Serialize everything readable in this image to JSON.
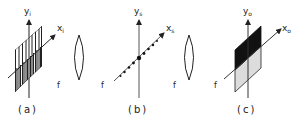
{
  "figure": {
    "panels": [
      {
        "id": "a",
        "label": "(a)",
        "y_axis": {
          "name": "y",
          "subscript": "i"
        },
        "x_axis": {
          "name": "x",
          "subscript": "i"
        },
        "object": "vertical-line grating"
      },
      {
        "id": "b",
        "label": "(b)",
        "y_axis": {
          "name": "y",
          "subscript": "s"
        },
        "x_axis": {
          "name": "x",
          "subscript": "s"
        },
        "object": "dot series along x-axis"
      },
      {
        "id": "c",
        "label": "(c)",
        "y_axis": {
          "name": "y",
          "subscript": "o"
        },
        "x_axis": {
          "name": "x",
          "subscript": "o"
        },
        "object": "half-black half-gray plane"
      }
    ],
    "focal_labels": [
      "f",
      "f",
      "f",
      "f",
      "f"
    ],
    "lenses": 2,
    "colors": {
      "ink": "#222222",
      "gray_fill": "#dcdcdc",
      "black_fill": "#111111"
    }
  }
}
